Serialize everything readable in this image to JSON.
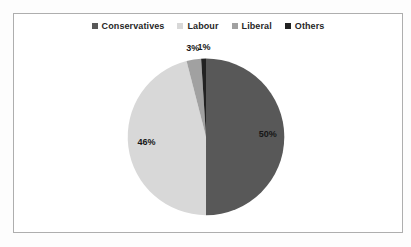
{
  "chart_data": {
    "type": "pie",
    "title": "",
    "categories": [
      "Conservatives",
      "Labour",
      "Liberal",
      "Others"
    ],
    "values": [
      50,
      46,
      3,
      1
    ],
    "data_labels": [
      "50%",
      "46%",
      "3%",
      "1%"
    ],
    "colors": [
      "#585858",
      "#d8d8d8",
      "#a1a1a1",
      "#222222"
    ],
    "legend_position": "top",
    "legend_text_color": "#262626",
    "data_label_color": "#161616",
    "start_angle_deg": 0,
    "direction": "clockwise",
    "frame_border_color": "#aeaeae",
    "background_color": "#ffffff"
  }
}
